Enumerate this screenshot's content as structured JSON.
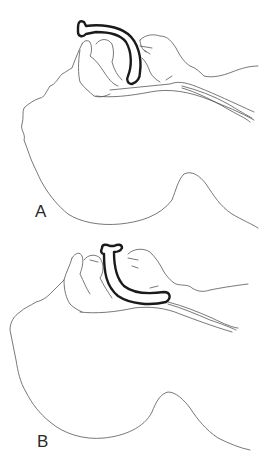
{
  "figure": {
    "panels": [
      {
        "id": "A",
        "label": "A",
        "description": "Sagittal head/neck outline with curved airway device inserted, tip positioned high near the base of the tongue"
      },
      {
        "id": "B",
        "label": "B",
        "description": "Sagittal head/neck outline with curved airway device inserted deeper, tip resting near the glottic opening"
      }
    ],
    "colors": {
      "outline": "#555555",
      "device": "#1a1a1a",
      "label": "#2a2a2a",
      "background": "#ffffff"
    }
  }
}
